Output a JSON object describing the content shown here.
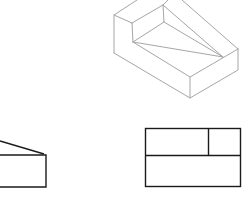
{
  "figure": {
    "colors": {
      "background": "#ffffff",
      "isometric_stroke": "#a6a6a6",
      "orthographic_stroke": "#1a1a1a"
    },
    "views": [
      {
        "name": "isometric-view"
      },
      {
        "name": "side-view"
      },
      {
        "name": "top-view"
      }
    ]
  }
}
